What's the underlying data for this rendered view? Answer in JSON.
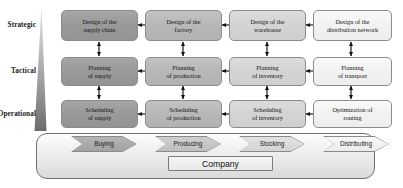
{
  "diagram": {
    "row_labels": [
      {
        "id": "strategic",
        "label": "Strategic"
      },
      {
        "id": "tactical",
        "label": "Tactical"
      },
      {
        "id": "operational",
        "label": "Operational"
      }
    ],
    "columns": [
      {
        "id": "supply",
        "shade": "#9a9a9a"
      },
      {
        "id": "production",
        "shade": "#b8b8b8"
      },
      {
        "id": "inventory",
        "shade": "#d4d4d4"
      },
      {
        "id": "distribution",
        "shade": "#f2f2f2"
      }
    ],
    "nodes": [
      {
        "id": "design-supply-chain",
        "line1": "Design of the",
        "line2": "supply chain"
      },
      {
        "id": "design-factory",
        "line1": "Design of the",
        "line2": "factory"
      },
      {
        "id": "design-warehouse",
        "line1": "Design of the",
        "line2": "warehouse"
      },
      {
        "id": "design-distribution-network",
        "line1": "Design of the",
        "line2": "distribution network"
      },
      {
        "id": "planning-supply",
        "line1": "Planning",
        "line2": "of supply"
      },
      {
        "id": "planning-production",
        "line1": "Planning",
        "line2": "of production"
      },
      {
        "id": "planning-inventory",
        "line1": "Planning",
        "line2": "of inventory"
      },
      {
        "id": "planning-transport",
        "line1": "Planning",
        "line2": "of transport"
      },
      {
        "id": "scheduling-supply",
        "line1": "Scheduling",
        "line2": "of supply"
      },
      {
        "id": "scheduling-production",
        "line1": "Scheduling",
        "line2": "of production"
      },
      {
        "id": "scheduling-inventory",
        "line1": "Scheduling",
        "line2": "of inventory"
      },
      {
        "id": "optimization-routing",
        "line1": "Optimization of",
        "line2": "routing"
      }
    ],
    "processes": [
      {
        "id": "buying",
        "label": "Buying"
      },
      {
        "id": "producing",
        "label": "Producing"
      },
      {
        "id": "stocking",
        "label": "Stocking"
      },
      {
        "id": "distributing",
        "label": "Distributing"
      }
    ],
    "company": {
      "label": "Company"
    },
    "wedge": {
      "id": "decision-level-wedge",
      "top_color": "#d8d8d8",
      "bottom_color": "#6e6e6e"
    }
  }
}
